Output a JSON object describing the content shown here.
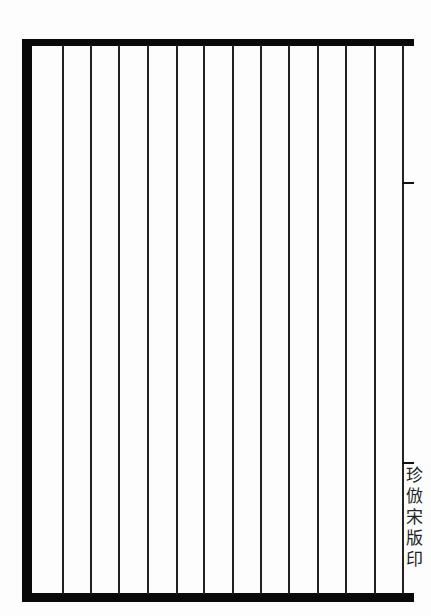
{
  "document": {
    "type": "ruled-manuscript-page",
    "margin_imprint": "珍倣宋版印",
    "column_line_positions_px": [
      62,
      90,
      118,
      147,
      176,
      203,
      232,
      260,
      288,
      317,
      345,
      374,
      402
    ],
    "frame_color": "#0a0a0a",
    "paper_color": "#fdfdfd",
    "right_ticks_y_px": [
      182,
      462
    ]
  }
}
